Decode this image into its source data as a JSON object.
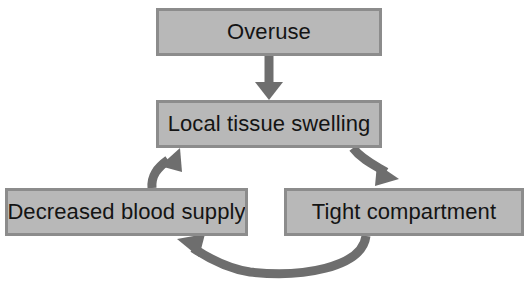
{
  "diagram": {
    "type": "cycle-flowchart",
    "background_color": "#ffffff",
    "node_fill_color": "#b8b8b8",
    "node_border_color": "#8c8c8c",
    "node_text_color": "#141414",
    "arrow_color": "#6e6e6e",
    "nodes": [
      {
        "id": "overuse",
        "label": "Overuse",
        "x": 156,
        "y": 8,
        "width": 226,
        "height": 48
      },
      {
        "id": "local-tissue-swelling",
        "label": "Local tissue swelling",
        "x": 156,
        "y": 100,
        "width": 226,
        "height": 48
      },
      {
        "id": "decreased-blood-supply",
        "label": "Decreased blood supply",
        "x": 5,
        "y": 188,
        "width": 243,
        "height": 48
      },
      {
        "id": "tight-compartment",
        "label": "Tight compartment",
        "x": 284,
        "y": 188,
        "width": 240,
        "height": 48
      }
    ],
    "edges": [
      {
        "id": "overuse-to-local-tissue-swelling",
        "from": "overuse",
        "to": "local-tissue-swelling",
        "style": "straight-down"
      },
      {
        "id": "local-tissue-swelling-to-tight-compartment",
        "from": "local-tissue-swelling",
        "to": "tight-compartment",
        "style": "curve-down-right"
      },
      {
        "id": "tight-compartment-to-decreased-blood-supply",
        "from": "tight-compartment",
        "to": "decreased-blood-supply",
        "style": "curve-bottom-left"
      },
      {
        "id": "decreased-blood-supply-to-local-tissue-swelling",
        "from": "decreased-blood-supply",
        "to": "local-tissue-swelling",
        "style": "curve-up-right"
      }
    ]
  }
}
